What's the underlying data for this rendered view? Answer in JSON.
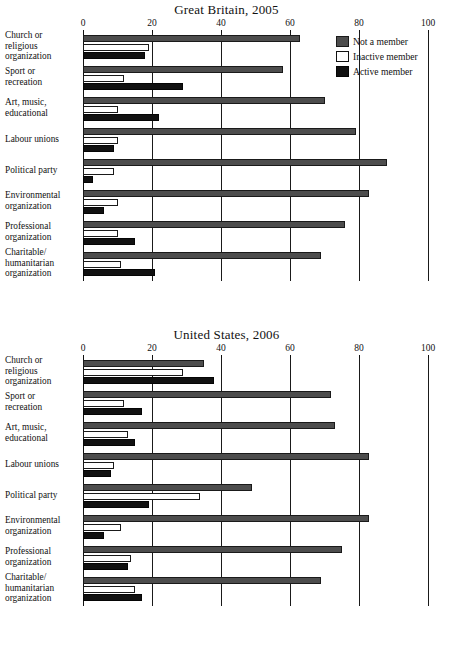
{
  "chart_data": [
    {
      "type": "bar",
      "orientation": "horizontal",
      "title": "Great Britain, 2005",
      "xlabel": "",
      "ylabel": "",
      "xlim": [
        0,
        100
      ],
      "xticks": [
        0,
        20,
        40,
        60,
        80,
        100
      ],
      "grid": true,
      "legend_position": "top-right",
      "categories": [
        "Church or religious organization",
        "Sport or recreation",
        "Art, music, educational",
        "Labour unions",
        "Political party",
        "Environmental organization",
        "Professional organization",
        "Charitable/ humanitarian organization"
      ],
      "series": [
        {
          "name": "Not a member",
          "values": [
            63,
            58,
            70,
            79,
            88,
            83,
            76,
            69
          ]
        },
        {
          "name": "Inactive member",
          "values": [
            19,
            12,
            10,
            10,
            9,
            10,
            10,
            11
          ]
        },
        {
          "name": "Active member",
          "values": [
            18,
            29,
            22,
            9,
            3,
            6,
            15,
            21
          ]
        }
      ]
    },
    {
      "type": "bar",
      "orientation": "horizontal",
      "title": "United States, 2006",
      "xlabel": "",
      "ylabel": "",
      "xlim": [
        0,
        100
      ],
      "xticks": [
        0,
        20,
        40,
        60,
        80,
        100
      ],
      "grid": true,
      "legend_position": "none",
      "categories": [
        "Church or religious organization",
        "Sport or recreation",
        "Art, music, educational",
        "Labour unions",
        "Political party",
        "Environmental organization",
        "Professional organization",
        "Charitable/ humanitarian organization"
      ],
      "series": [
        {
          "name": "Not a member",
          "values": [
            35,
            72,
            73,
            83,
            49,
            83,
            75,
            69
          ]
        },
        {
          "name": "Inactive member",
          "values": [
            29,
            12,
            13,
            9,
            34,
            11,
            14,
            15
          ]
        },
        {
          "name": "Active member",
          "values": [
            38,
            17,
            15,
            8,
            19,
            6,
            13,
            17
          ]
        }
      ]
    }
  ],
  "panels": [
    {
      "title": "Great Britain, 2005",
      "ticks": [
        "0",
        "20",
        "40",
        "60",
        "80",
        "100"
      ],
      "categories": [
        [
          "Church or",
          "religious",
          "organization"
        ],
        [
          "Sport or",
          "recreation"
        ],
        [
          "Art, music,",
          "educational"
        ],
        [
          "Labour unions"
        ],
        [
          "Political party"
        ],
        [
          "Environmental",
          "organization"
        ],
        [
          "Professional",
          "organization"
        ],
        [
          "Charitable/",
          "humanitarian",
          "organization"
        ]
      ]
    },
    {
      "title": "United States, 2006",
      "ticks": [
        "0",
        "20",
        "40",
        "60",
        "80",
        "100"
      ],
      "categories": [
        [
          "Church or",
          "religious",
          "organization"
        ],
        [
          "Sport or",
          "recreation"
        ],
        [
          "Art, music,",
          "educational"
        ],
        [
          "Labour unions"
        ],
        [
          "Political party"
        ],
        [
          "Environmental",
          "organization"
        ],
        [
          "Professional",
          "organization"
        ],
        [
          "Charitable/",
          "humanitarian",
          "organization"
        ]
      ]
    }
  ],
  "legend": {
    "items": [
      {
        "label": "Not a member",
        "key": "notmember",
        "color": "#4d4d4d"
      },
      {
        "label": "Inactive member",
        "key": "inactive",
        "color": "#ffffff"
      },
      {
        "label": "Active member",
        "key": "active",
        "color": "#111111"
      }
    ]
  }
}
